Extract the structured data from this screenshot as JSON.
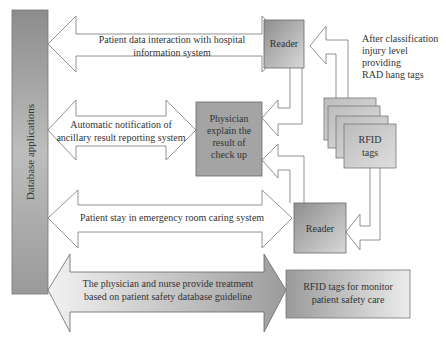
{
  "diagram": {
    "sidebar_label": "Database applications",
    "flows": [
      {
        "line1": "Patient data interaction with hospital",
        "line2": "information system"
      },
      {
        "line1": "Automatic notification of",
        "line2": "ancillary result reporting system"
      },
      {
        "line1": "Patient stay in emergency room caring system"
      },
      {
        "line1": "The physician and nurse provide treatment",
        "line2": "based on patient safety database guideline"
      }
    ],
    "nodes": {
      "reader_top": "Reader",
      "reader_bottom": "Reader",
      "physician": [
        "Physician",
        "explain the",
        "result of",
        "check up"
      ],
      "rfid_tags": [
        "RFID",
        "tags"
      ],
      "rfid_monitor": [
        "RFID tags for monitor",
        "patient safety care"
      ]
    },
    "annotation": [
      "After classification",
      "injury level",
      "providing",
      "RAD hang tags"
    ],
    "colors": {
      "box_dark": "#8a8a8a",
      "box_mid": "#b0b0b0",
      "box_light": "#e8e8e8",
      "stroke": "#666666",
      "text": "#333333"
    }
  }
}
